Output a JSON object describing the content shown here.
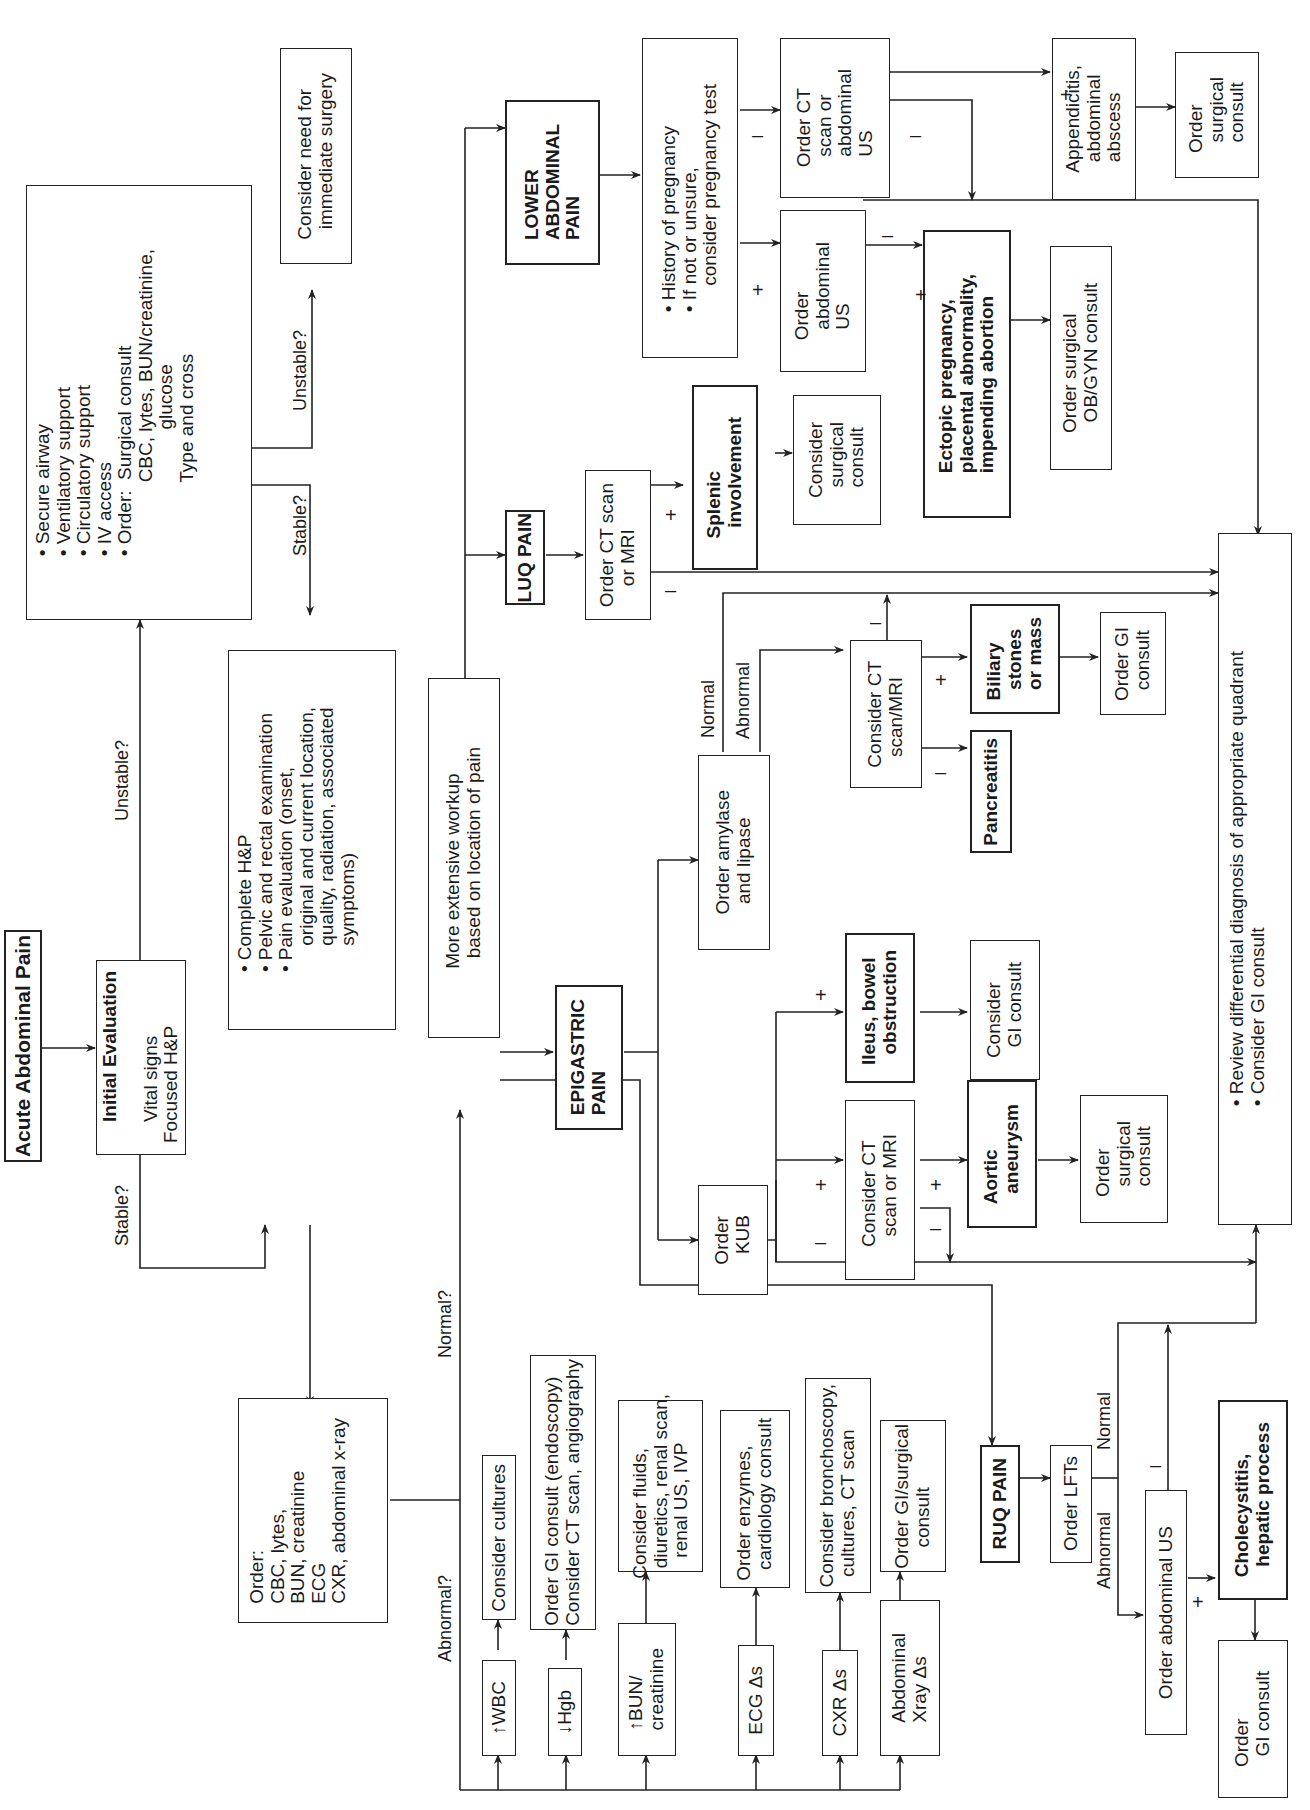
{
  "title": "Acute Abdominal Pain",
  "initial_eval": {
    "heading": "Initial Evaluation",
    "lines": "Vital signs\nFocused H&P"
  },
  "labels": {
    "stable": "Stable?",
    "unstable": "Unstable?",
    "stable2": "Stable?",
    "unstable2": "Unstable?",
    "normal_q": "Normal?",
    "abnormal_q": "Abnormal?",
    "amylase_normal": "Normal",
    "amylase_abnormal": "Abnormal",
    "lft_normal": "Normal",
    "lft_abnormal": "Abnormal",
    "plus": "+",
    "minus": "–"
  },
  "unstable_box": "• Secure airway\n• Ventilatory support\n• Circulatory support\n• IV access\n• Order:  Surgical consult\n              CBC, lytes, BUN/creatinine,\n                        glucose\n              Type and cross",
  "surgery_box": "Consider need for\n  immediate surgery",
  "complete_hp_box": "• Complete H&P\n• Pelvic and rectal examination\n• Pain evaluation (onset,\n     original and current location,\n     quality, radiation, associated\n     symptoms)",
  "order_labs_box": "Order:\nCBC, lytes,\nBUN, creatinine\nECG\nCXR, abdominal x-ray",
  "workup_box": "More extensive workup\n  based on location of pain",
  "abnormal_findings": [
    {
      "finding": "↑WBC",
      "action": "Consider cultures"
    },
    {
      "finding": "↓Hgb",
      "action": "Order GI consult (endoscopy)\nConsider CT scan, angiography"
    },
    {
      "finding": "↑BUN/\ncreatinine",
      "action": "Consider fluids,\n  diuretics, renal scan,\n    renal US, IVP"
    },
    {
      "finding": "ECG Δs",
      "action": "Order enzymes,\n  cardiology consult"
    },
    {
      "finding": "CXR Δs",
      "action": "Consider bronchoscopy,\n  cultures, CT scan"
    },
    {
      "finding": "Abdominal\nXray Δs",
      "action": "Order GI/surgical\n    consult"
    }
  ],
  "lower": {
    "heading": "LOWER\nABDOMINAL\nPAIN",
    "pregnancy_box": "• History of pregnancy\n• If not or unsure,\n     consider pregnancy test",
    "ct_us_box": "Order CT\n  scan or\n  abdominal\n  US",
    "abd_us_box": "Order\n  abdominal\n  US",
    "appendicitis_box": "Appendicitis,\n  abdominal\n  abscess",
    "surgical_consult_box": "Order\n  surgical\n  consult",
    "ectopic_box": "Ectopic pregnancy,\nplacental abnormality,\nimpending abortion",
    "obgyn_box": "Order surgical\n  OB/GYN consult"
  },
  "luq": {
    "heading": "LUQ PAIN",
    "ct_box": "Order CT scan\n    or MRI",
    "splenic_box": "Splenic\n  involvement",
    "consult_box": "Consider\n  surgical\n  consult"
  },
  "epigastric": {
    "heading": "EPIGASTRIC\nPAIN",
    "amylase_box": "Order amylase\n  and lipase",
    "kub_box": "Order\n  KUB",
    "ct_mri_box": "Consider CT\n  scan/MRI",
    "biliary_box": "Biliary\n  stones\n  or mass",
    "gi_consult_box": "Order GI\n  consult",
    "pancreatitis_box": "Pancreatitis",
    "ileus_box": "Ileus, bowel\n  obstruction",
    "gi_consult2_box": "Consider\n  GI consult",
    "ct_mri2_box": "Consider CT\n  scan or MRI",
    "aortic_box": "Aortic\n  aneurysm",
    "surgical_box": "Order\n  surgical\n  consult"
  },
  "ruq": {
    "heading": "RUQ PAIN",
    "lfts_box": "Order LFTs",
    "abd_us_box": "Order abdominal US",
    "chole_box": "Cholecystitis,\n  hepatic process",
    "gi_box": "Order\n  GI consult"
  },
  "review_box": "• Review differential diagnosis of appropriate quadrant\n• Consider GI consult"
}
